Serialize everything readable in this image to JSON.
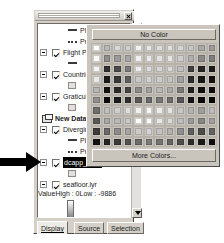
{
  "window": {
    "title_bar_name": "table-of-contents",
    "close_label": "✕"
  },
  "toc": {
    "rows": [
      {
        "kind": "symbol-line",
        "label": "Planned",
        "indent": 30
      },
      {
        "kind": "symbol-dash",
        "label": "Probable",
        "indent": 30
      },
      {
        "kind": "layer",
        "label": "Flight Path",
        "indent": 14,
        "checked": true
      },
      {
        "kind": "symbol-line2",
        "label": "",
        "indent": 30
      },
      {
        "kind": "layer",
        "label": "Countries",
        "indent": 14,
        "checked": true
      },
      {
        "kind": "symbol-box",
        "label": "",
        "indent": 30
      },
      {
        "kind": "layer",
        "label": "Graticule",
        "indent": 14,
        "checked": true
      },
      {
        "kind": "symbol-box",
        "label": "",
        "indent": 30
      },
      {
        "kind": "dataframe",
        "label": "New Data Fram",
        "indent": 4
      },
      {
        "kind": "layer",
        "label": "Diverging Fligl",
        "indent": 14,
        "checked": true
      },
      {
        "kind": "symbol-line",
        "label": "Planned",
        "indent": 30
      },
      {
        "kind": "symbol-dash",
        "label": "Probable",
        "indent": 30
      },
      {
        "kind": "layer-sel",
        "label": "dcapp_area",
        "indent": 14,
        "checked": true
      },
      {
        "kind": "symbol-box",
        "label": "",
        "indent": 30
      },
      {
        "kind": "layer",
        "label": "seafloor.lyr",
        "indent": 14,
        "checked": true
      }
    ],
    "legend": {
      "value_label": "Value",
      "high_label": "High : 0",
      "low_label": "Low : -9886"
    }
  },
  "tabs": [
    {
      "label": "Display",
      "active": true
    },
    {
      "label": "Source",
      "active": false
    },
    {
      "label": "Selection",
      "active": false
    }
  ],
  "color_popup": {
    "no_color_label": "No Color",
    "more_colors_label": "More Colors...",
    "columns": 12,
    "rows": 10,
    "swatches": [
      "#ffffff",
      "#b9b9b9",
      "#d8d8d8",
      "#cfcfcf",
      "#f2f2f2",
      "#e6e6e6",
      "#dddddd",
      "#e0e0e0",
      "#d5d5d5",
      "#c7c7c7",
      "#a8a8a8",
      "#9c9c9c",
      "#fbfbfb",
      "#8e8e8e",
      "#9a9a9a",
      "#a6a6a6",
      "#efefef",
      "#e9e9e9",
      "#e2e2e2",
      "#e4e4e4",
      "#cdcdcd",
      "#b0b0b0",
      "#8a8a8a",
      "#7e7e7e",
      "#f4f4f4",
      "#2f2f2f",
      "#4a4a4a",
      "#7b7b7b",
      "#ededed",
      "#dcdcdc",
      "#d6d6d6",
      "#d9d9d9",
      "#bfbfbf",
      "#3f3f3f",
      "#262626",
      "#1d1d1d",
      "#e8e8e8",
      "#1a1a1a",
      "#383838",
      "#5e5e5e",
      "#c9c9c9",
      "#d2d2d2",
      "#cccccc",
      "#c4c4c4",
      "#9f9f9f",
      "#2b2b2b",
      "#171717",
      "#121212",
      "#b5b5b5",
      "#121212",
      "#2a2a2a",
      "#444444",
      "#8b8b8b",
      "#a2a2a2",
      "#b7b7b7",
      "#ababab",
      "#7a7a7a",
      "#1f1f1f",
      "#101010",
      "#0d0d0d",
      "#8f8f8f",
      "#0a0a0a",
      "#1c1c1c",
      "#303030",
      "#5a5a5a",
      "#6b6b6b",
      "#777777",
      "#6f6f6f",
      "#565656",
      "#141414",
      "#0a0a0a",
      "#080808",
      "#6e6e6e",
      "#c0c0c0",
      "#cfcfcf",
      "#dedede",
      "#f0f0f0",
      "#f6f6f6",
      "#ececec",
      "#e3e3e3",
      "#c6c6c6",
      "#b4b4b4",
      "#9e9e9e",
      "#bcbcbc",
      "#585858",
      "#a7a7a7",
      "#b9b9b9",
      "#c8c8c8",
      "#ffffff",
      "#fafafa",
      "#e8e8e8",
      "#dadada",
      "#bdbdbd",
      "#9b9b9b",
      "#868686",
      "#a0a0a0",
      "#3c3c3c",
      "#6a6a6a",
      "#8c8c8c",
      "#a4a4a4",
      "#cbcbcb",
      "#d4d4d4",
      "#c2c2c2",
      "#b1b1b1",
      "#8f8f8f",
      "#5f5f5f",
      "#4c4c4c",
      "#636363",
      "#121212",
      "#242424",
      "#3a3a3a",
      "#525252",
      "#6d6d6d",
      "#7c7c7c",
      "#747474",
      "#656565",
      "#4e4e4e",
      "#2c2c2c",
      "#1a1a1a",
      "#0e0e0e"
    ]
  },
  "annotation": {
    "arrow_name": "callout-arrow"
  }
}
